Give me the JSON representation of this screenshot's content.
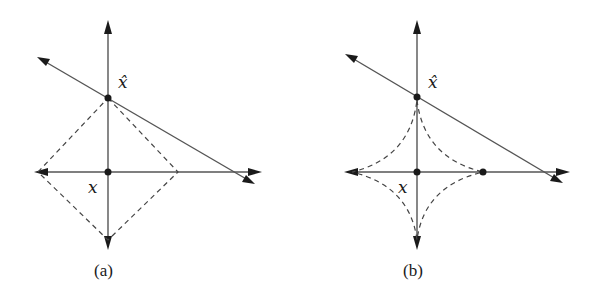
{
  "figure": {
    "panels": [
      {
        "id": "a",
        "caption": "(a)",
        "point_label_hat": "x̂",
        "point_label_origin": "x",
        "unit_ball_shape": "diamond (L1 ball)"
      },
      {
        "id": "b",
        "caption": "(b)",
        "point_label_hat": "x̂",
        "point_label_origin": "x",
        "unit_ball_shape": "astroid (Lp ball, p<1)"
      }
    ]
  },
  "colors": {
    "line": "#555555",
    "dashed": "#444444",
    "ink": "#1a1a1a",
    "background": "#ffffff"
  }
}
